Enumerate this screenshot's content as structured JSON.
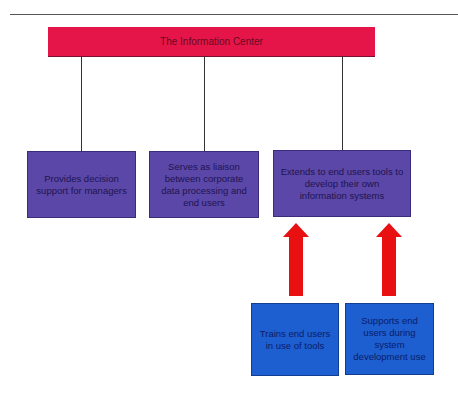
{
  "diagram": {
    "title": "The Information Center",
    "functions": [
      {
        "label": "Provides decision support for managers"
      },
      {
        "label": "Serves as liaison between corporate data processing and end users"
      },
      {
        "label": "Extends to end users tools to develop their own information systems"
      }
    ],
    "supporting": [
      {
        "label": "Trains end users in use of tools"
      },
      {
        "label": "Supports end users during system development use"
      }
    ],
    "colors": {
      "header": "#e5154a",
      "function_box": "#5b47a8",
      "support_box": "#1d5fd0",
      "arrow": "#e81010"
    }
  }
}
